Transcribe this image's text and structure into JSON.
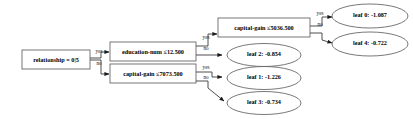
{
  "diagram": {
    "type": "decision-tree",
    "title": "",
    "background_color": "#ffffff",
    "node_stroke_color": "#555555",
    "edge_color": "#3a3a3a",
    "text_color": "#000000",
    "edge_labels": {
      "yes": "yes",
      "no": "no"
    },
    "decision_nodes": [
      {
        "id": "root",
        "label": "relationship = 0|5",
        "feature": "relationship",
        "operator": "=",
        "threshold": "0|5",
        "yes_child": "education-num",
        "no_child": "capital-gain-7073"
      },
      {
        "id": "education-num",
        "label": "education-num ≤12.500",
        "feature": "education-num",
        "operator": "≤",
        "threshold": "12.500",
        "yes_child": "capital-gain-5036",
        "no_child": "leaf2"
      },
      {
        "id": "capital-gain-7073",
        "label": "capital-gain ≤7073.500",
        "feature": "capital-gain",
        "operator": "≤",
        "threshold": "7073.500",
        "yes_child": "leaf1",
        "no_child": "leaf3"
      },
      {
        "id": "capital-gain-5036",
        "label": "capital-gain ≤5036.500",
        "feature": "capital-gain",
        "operator": "≤",
        "threshold": "5036.500",
        "yes_child": "leaf0",
        "no_child": "leaf4"
      }
    ],
    "leaf_nodes": [
      {
        "id": "leaf0",
        "label": "leaf 0:  -1.087",
        "name": "leaf 0",
        "value": -1.087
      },
      {
        "id": "leaf4",
        "label": "leaf 4:  -0.722",
        "name": "leaf 4",
        "value": -0.722
      },
      {
        "id": "leaf2",
        "label": "leaf 2:  -0.854",
        "name": "leaf 2",
        "value": -0.854
      },
      {
        "id": "leaf1",
        "label": "leaf 1:  -1.226",
        "name": "leaf 1",
        "value": -1.226
      },
      {
        "id": "leaf3",
        "label": "leaf 3:  -0.734",
        "name": "leaf 3",
        "value": -0.734
      }
    ]
  }
}
